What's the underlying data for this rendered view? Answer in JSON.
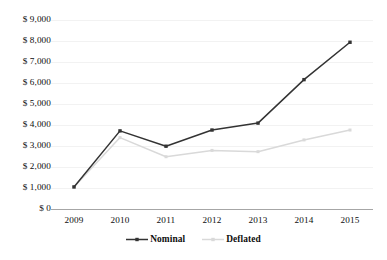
{
  "chart_data": {
    "type": "line",
    "title": "",
    "subtitle": "",
    "xlabel": "",
    "ylabel": "",
    "categories": [
      "2009",
      "2010",
      "2011",
      "2012",
      "2013",
      "2014",
      "2015"
    ],
    "series": [
      {
        "name": "Nominal",
        "color": "#333333",
        "marker": "square",
        "values": [
          1050,
          3720,
          2990,
          3760,
          4090,
          6160,
          7940
        ]
      },
      {
        "name": "Deflated",
        "color": "#d9d9d9",
        "marker": "square",
        "values": [
          1050,
          3400,
          2490,
          2790,
          2730,
          3290,
          3760
        ]
      }
    ],
    "ylim": [
      0,
      9000
    ],
    "ytick_step": 1000,
    "ytick_labels": [
      "$ 9,000",
      "$ 8,000",
      "$ 7,000",
      "$ 6,000",
      "$ 5,000",
      "$ 4,000",
      "$ 3,000",
      "$ 2,000",
      "$ 1,000",
      "$ 0"
    ],
    "ytick_values": [
      9000,
      8000,
      7000,
      6000,
      5000,
      4000,
      3000,
      2000,
      1000,
      0
    ],
    "grid": true,
    "grid_color": "#f2f2f2",
    "axis_color": "#a6a6a6",
    "legend_position": "bottom",
    "legend": [
      {
        "label": "Nominal",
        "color": "#333333"
      },
      {
        "label": "Deflated",
        "color": "#d9d9d9"
      }
    ]
  }
}
